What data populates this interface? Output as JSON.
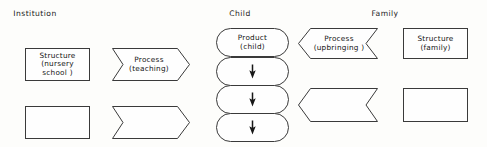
{
  "diagram": {
    "background_color": "#fdfdfb",
    "line_color": "#3a3a3a",
    "text_color": "#141414",
    "headers": [
      {
        "id": "institution",
        "label": "Institution",
        "x": 35,
        "y": 9
      },
      {
        "id": "child",
        "label": "Child",
        "x": 240,
        "y": 9
      },
      {
        "id": "family",
        "label": "Family",
        "x": 385,
        "y": 9
      }
    ],
    "columns": {
      "institution": {
        "structure": {
          "shape": "rectangle",
          "lines": [
            "Structure",
            "(nursery",
            "school )"
          ],
          "x": 25,
          "y": 48,
          "w": 65,
          "h": 33
        },
        "process": {
          "shape": "chevron-right",
          "lines": [
            "Process",
            "(teaching)"
          ],
          "x": 112,
          "y": 48,
          "w": 78,
          "h": 33
        },
        "structure_blank": {
          "shape": "rectangle",
          "lines": [],
          "x": 25,
          "y": 106,
          "w": 65,
          "h": 33
        },
        "process_blank": {
          "shape": "chevron-right",
          "lines": [],
          "x": 112,
          "y": 106,
          "w": 78,
          "h": 33
        }
      },
      "child": {
        "cells": [
          {
            "id": "product",
            "shape": "stadium",
            "lines": [
              "Product",
              "(child)"
            ],
            "glyph": "",
            "x": 216,
            "y": 28,
            "w": 73,
            "h": 29
          },
          {
            "id": "flow-1",
            "shape": "stadium",
            "lines": [],
            "glyph": "arrow-down",
            "x": 216,
            "y": 57,
            "w": 73,
            "h": 29
          },
          {
            "id": "flow-2",
            "shape": "stadium",
            "lines": [],
            "glyph": "arrow-down",
            "x": 216,
            "y": 85,
            "w": 73,
            "h": 29
          },
          {
            "id": "flow-3",
            "shape": "stadium",
            "lines": [],
            "glyph": "arrow-down",
            "x": 216,
            "y": 113,
            "w": 73,
            "h": 29
          }
        ]
      },
      "family": {
        "process": {
          "shape": "chevron-left",
          "lines": [
            "Process",
            "(upbringing )"
          ],
          "x": 298,
          "y": 28,
          "w": 80,
          "h": 31
        },
        "structure": {
          "shape": "rectangle",
          "lines": [
            "Structure",
            "(family)"
          ],
          "x": 403,
          "y": 28,
          "w": 65,
          "h": 31
        },
        "process_blank": {
          "shape": "chevron-left",
          "lines": [],
          "x": 298,
          "y": 88,
          "w": 80,
          "h": 34
        },
        "structure_blank": {
          "shape": "rectangle",
          "lines": [],
          "x": 403,
          "y": 88,
          "w": 65,
          "h": 34
        }
      }
    }
  }
}
